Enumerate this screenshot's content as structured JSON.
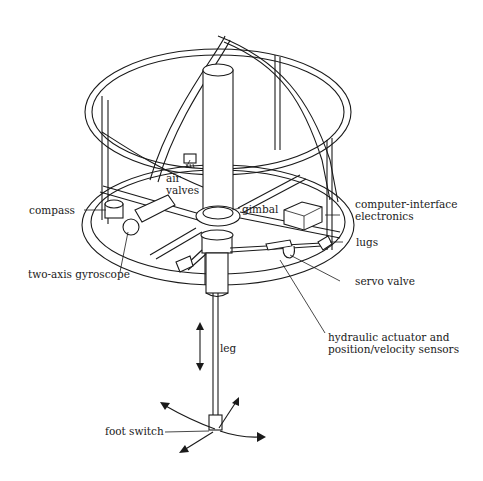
{
  "diagram": {
    "labels": {
      "air_valves": "air\nvalves",
      "air_valves_line1": "air",
      "air_valves_line2": "valves",
      "gimbal": "gimbal",
      "compass": "compass",
      "computer_interface_line1": "computer-interface",
      "computer_interface_line2": "electronics",
      "lugs": "lugs",
      "two_axis_gyroscope": "two-axis gyroscope",
      "servo_valve": "servo valve",
      "hydraulic_line1": "hydraulic actuator and",
      "hydraulic_line2": "position/velocity sensors",
      "leg": "leg",
      "foot_switch": "foot switch"
    },
    "colors": {
      "ink": "#1a1a1a",
      "background": "#ffffff"
    }
  }
}
